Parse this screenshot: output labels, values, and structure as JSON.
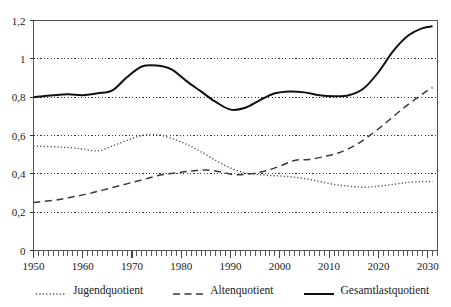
{
  "chart_data": {
    "type": "line",
    "title": "",
    "xlabel": "",
    "ylabel": "",
    "xlim": [
      1950,
      2032
    ],
    "ylim": [
      0,
      1.2
    ],
    "grid": true,
    "grid_style": "dotted-horizontal",
    "legend_position": "bottom",
    "x_tick_labels": [
      "1950",
      "1960",
      "1970",
      "1980",
      "1990",
      "2000",
      "2010",
      "2020",
      "2030"
    ],
    "x_tick_values": [
      1950,
      1960,
      1970,
      1980,
      1990,
      2000,
      2010,
      2020,
      2030
    ],
    "x_minor_tick_interval": 1,
    "y_tick_labels": [
      "0",
      "0,2",
      "0,4",
      "0,6",
      "0,8",
      "1",
      "1,2"
    ],
    "y_tick_values": [
      0,
      0.2,
      0.4,
      0.6,
      0.8,
      1.0,
      1.2
    ],
    "series": [
      {
        "name": "Jugendquotient",
        "style": "dotted",
        "color": "#4d4d4d",
        "x": [
          1950,
          1955,
          1958,
          1960,
          1963,
          1966,
          1969,
          1972,
          1975,
          1978,
          1981,
          1984,
          1987,
          1990,
          1993,
          1996,
          1999,
          2002,
          2005,
          2008,
          2011,
          2014,
          2017,
          2020,
          2023,
          2026,
          2029,
          2031
        ],
        "values": [
          0.545,
          0.54,
          0.535,
          0.53,
          0.52,
          0.545,
          0.575,
          0.6,
          0.605,
          0.585,
          0.555,
          0.515,
          0.47,
          0.43,
          0.405,
          0.395,
          0.39,
          0.385,
          0.375,
          0.36,
          0.345,
          0.335,
          0.33,
          0.335,
          0.345,
          0.355,
          0.36,
          0.36
        ]
      },
      {
        "name": "Altenquotient",
        "style": "dashed",
        "color": "#3a3a3a",
        "x": [
          1950,
          1955,
          1958,
          1961,
          1964,
          1967,
          1970,
          1973,
          1976,
          1979,
          1982,
          1985,
          1988,
          1991,
          1994,
          1997,
          2000,
          2003,
          2006,
          2009,
          2012,
          2015,
          2018,
          2021,
          2024,
          2027,
          2030,
          2031
        ],
        "values": [
          0.25,
          0.265,
          0.28,
          0.295,
          0.315,
          0.335,
          0.355,
          0.375,
          0.395,
          0.405,
          0.415,
          0.42,
          0.41,
          0.395,
          0.4,
          0.415,
          0.44,
          0.47,
          0.475,
          0.49,
          0.51,
          0.545,
          0.595,
          0.655,
          0.72,
          0.78,
          0.835,
          0.85
        ]
      },
      {
        "name": "Gesamtlastquotient",
        "style": "solid",
        "color": "#111111",
        "x": [
          1950,
          1954,
          1957,
          1960,
          1963,
          1966,
          1969,
          1972,
          1975,
          1978,
          1981,
          1984,
          1987,
          1990,
          1993,
          1996,
          1999,
          2002,
          2005,
          2008,
          2011,
          2014,
          2017,
          2020,
          2023,
          2026,
          2029,
          2031
        ],
        "values": [
          0.8,
          0.81,
          0.815,
          0.81,
          0.82,
          0.835,
          0.905,
          0.96,
          0.965,
          0.945,
          0.885,
          0.83,
          0.775,
          0.735,
          0.745,
          0.785,
          0.82,
          0.83,
          0.825,
          0.81,
          0.805,
          0.81,
          0.845,
          0.93,
          1.04,
          1.12,
          1.16,
          1.17
        ]
      }
    ]
  },
  "legend": {
    "items": [
      {
        "label": "Jugendquotient",
        "style": "dotted"
      },
      {
        "label": "Altenquotient",
        "style": "dashed"
      },
      {
        "label": "Gesamtlastquotient",
        "style": "solid"
      }
    ]
  }
}
